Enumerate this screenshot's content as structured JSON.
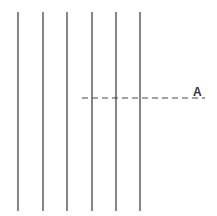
{
  "diagram": {
    "stroke_color": "#444444",
    "vertical_lines": [
      {
        "x": 18,
        "y1": 12,
        "y2": 211
      },
      {
        "x": 43,
        "y1": 12,
        "y2": 211
      },
      {
        "x": 67,
        "y1": 12,
        "y2": 211
      },
      {
        "x": 92,
        "y1": 12,
        "y2": 211
      },
      {
        "x": 116,
        "y1": 12,
        "y2": 211
      },
      {
        "x": 140,
        "y1": 12,
        "y2": 211
      }
    ],
    "dashed_line": {
      "x1": 82,
      "x2": 205,
      "y": 98
    },
    "label": {
      "text": "A",
      "x": 193,
      "y": 86
    }
  }
}
